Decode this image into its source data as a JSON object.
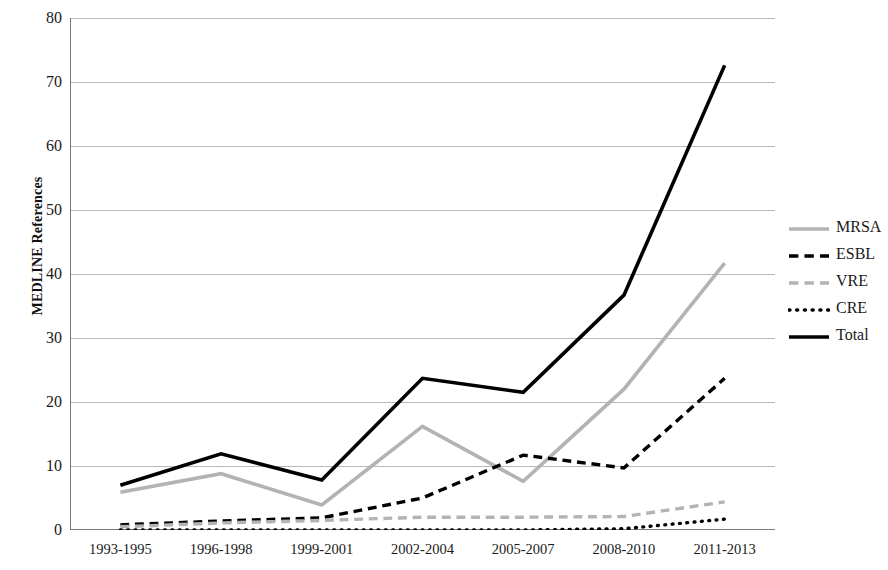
{
  "chart_data": {
    "type": "line",
    "title": "",
    "xlabel": "",
    "ylabel": "MEDLINE References",
    "categories": [
      "1993-1995",
      "1996-1998",
      "1999-2001",
      "2002-2004",
      "2005-2007",
      "2008-2010",
      "2011-2013"
    ],
    "ylim": [
      0,
      80
    ],
    "yticks": [
      0,
      10,
      20,
      30,
      40,
      50,
      60,
      70,
      80
    ],
    "grid": "horizontal",
    "legend_position": "right",
    "series": [
      {
        "name": "MRSA",
        "style": "solid",
        "color": "#b3b3b3",
        "values": [
          5.9,
          8.8,
          3.9,
          16.2,
          7.6,
          22.0,
          41.7
        ]
      },
      {
        "name": "ESBL",
        "style": "dashed",
        "color": "#000000",
        "values": [
          0.8,
          1.4,
          1.9,
          5.0,
          11.7,
          9.7,
          23.7
        ]
      },
      {
        "name": "VRE",
        "style": "dashed",
        "color": "#b3b3b3",
        "values": [
          0.5,
          1.1,
          1.5,
          2.0,
          2.0,
          2.1,
          4.4
        ]
      },
      {
        "name": "CRE",
        "style": "dotted",
        "color": "#000000",
        "values": [
          0.0,
          0.0,
          0.0,
          0.0,
          0.0,
          0.2,
          1.7
        ]
      },
      {
        "name": "Total",
        "style": "solid",
        "color": "#000000",
        "values": [
          7.0,
          11.9,
          7.8,
          23.7,
          21.5,
          36.7,
          72.6
        ]
      }
    ]
  },
  "axis": {
    "y_title": "MEDLINE References",
    "y_tick_labels": [
      "80",
      "70",
      "60",
      "50",
      "40",
      "30",
      "20",
      "10",
      "0"
    ],
    "x_tick_labels": [
      "1993-1995",
      "1996-1998",
      "1999-2001",
      "2002-2004",
      "2005-2007",
      "2008-2010",
      "2011-2013"
    ]
  },
  "legend": {
    "entries": [
      {
        "label": "MRSA",
        "color": "#b3b3b3",
        "style": "solid"
      },
      {
        "label": "ESBL",
        "color": "#000000",
        "style": "dashed"
      },
      {
        "label": "VRE",
        "color": "#b3b3b3",
        "style": "dashed"
      },
      {
        "label": "CRE",
        "color": "#000000",
        "style": "dotted"
      },
      {
        "label": "Total",
        "color": "#000000",
        "style": "solid"
      }
    ]
  },
  "colors": {
    "grid": "#b9b9b9",
    "axis": "#7a7a7a",
    "text": "#1a1a1a",
    "gray_series": "#b3b3b3",
    "black_series": "#000000"
  }
}
